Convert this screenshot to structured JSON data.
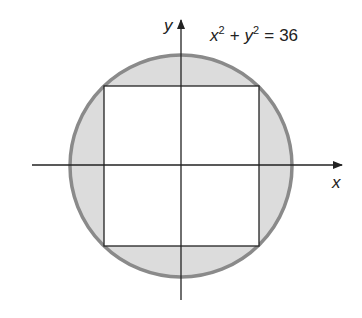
{
  "diagram": {
    "equation": {
      "x_var": "x",
      "x_exp": "2",
      "plus": "+",
      "y_var": "y",
      "y_exp": "2",
      "equals": "=",
      "rhs": "36"
    },
    "axes": {
      "x_label": "x",
      "y_label": "y"
    },
    "colors": {
      "circle_fill": "#dcdcdc",
      "circle_stroke": "#8a8a8a",
      "square_fill": "#ffffff",
      "line": "#222222"
    },
    "shapes": {
      "circle": {
        "cx": 181,
        "cy": 166,
        "r": 111
      },
      "square": {
        "x": 104,
        "y": 86,
        "w": 155,
        "h": 160
      }
    }
  }
}
